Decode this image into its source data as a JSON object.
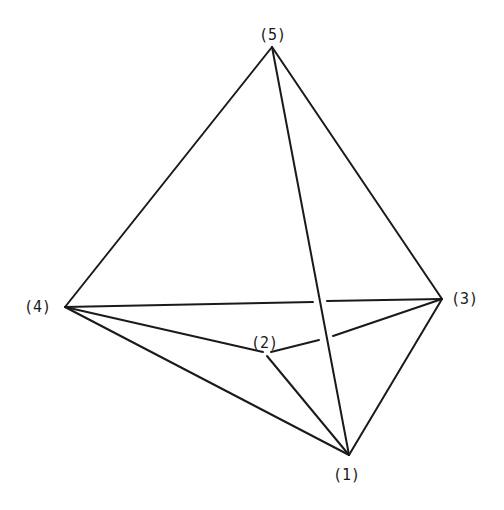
{
  "diagram": {
    "type": "polyhedron-graph",
    "vertices": [
      {
        "id": "1",
        "label": "(1)",
        "x": 349,
        "y": 455,
        "label_x": 333,
        "label_y": 480
      },
      {
        "id": "2",
        "label": "(2)",
        "x": 267,
        "y": 352,
        "label_x": 251,
        "label_y": 348
      },
      {
        "id": "3",
        "label": "(3)",
        "x": 442,
        "y": 299,
        "label_x": 451,
        "label_y": 304
      },
      {
        "id": "4",
        "label": "(4)",
        "x": 65,
        "y": 307,
        "label_x": 24,
        "label_y": 312
      },
      {
        "id": "5",
        "label": "(5)",
        "x": 272,
        "y": 47,
        "label_x": 259,
        "label_y": 40
      }
    ],
    "edges": [
      {
        "from": "5",
        "to": "4"
      },
      {
        "from": "5",
        "to": "3"
      },
      {
        "from": "5",
        "to": "1"
      },
      {
        "from": "4",
        "to": "3",
        "broken": true
      },
      {
        "from": "4",
        "to": "2"
      },
      {
        "from": "4",
        "to": "1"
      },
      {
        "from": "2",
        "to": "3",
        "broken": true
      },
      {
        "from": "2",
        "to": "1"
      },
      {
        "from": "3",
        "to": "1"
      }
    ],
    "line_color": "#1a1a1a",
    "background": "#ffffff"
  }
}
